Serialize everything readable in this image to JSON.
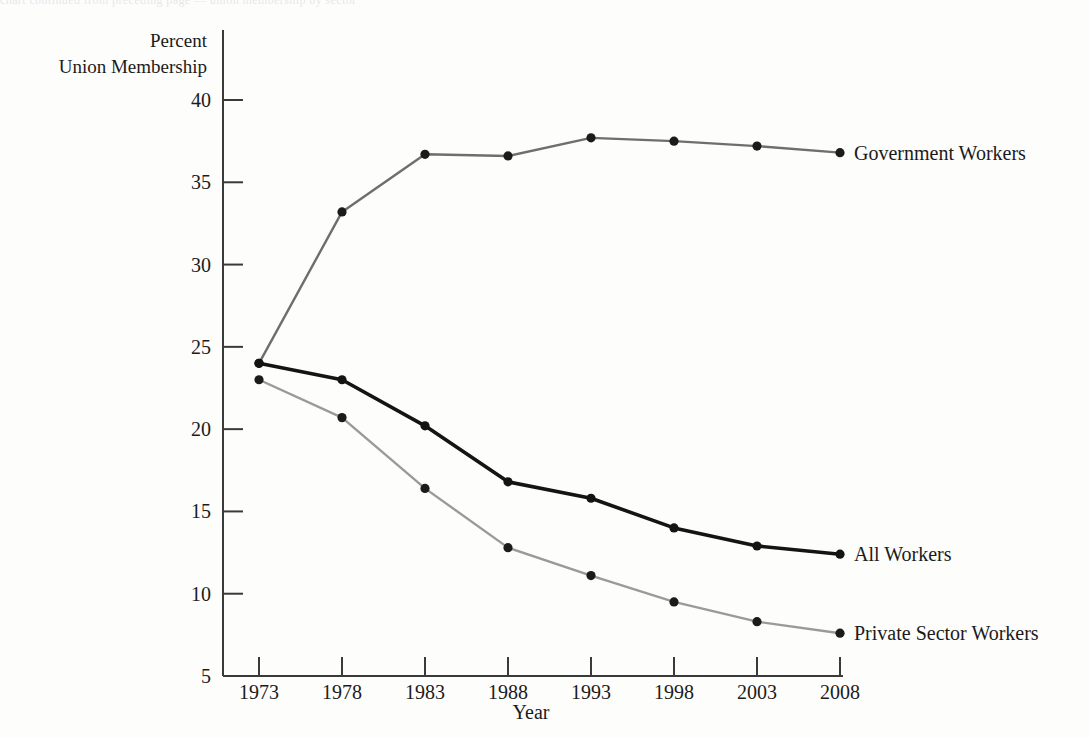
{
  "page": {
    "bleed_text": "chart continued from preceding page — union membership by sector"
  },
  "chart_data": {
    "type": "line",
    "title": "",
    "subtitle": "",
    "xlabel": "Year",
    "ylabel": "Percent Union Membership",
    "ylabel_lines": [
      "Percent",
      "Union Membership"
    ],
    "categories": [
      1973,
      1978,
      1983,
      1988,
      1993,
      1998,
      2003,
      2008
    ],
    "xtick_labels": [
      "1973",
      "1978",
      "1983",
      "1988",
      "1993",
      "1998",
      "2003",
      "2008"
    ],
    "ytick_labels": [
      "40",
      "35",
      "30",
      "25",
      "20",
      "15",
      "10",
      "5"
    ],
    "yticks": [
      40,
      35,
      30,
      25,
      20,
      15,
      10,
      5
    ],
    "ylim": [
      5,
      40
    ],
    "xlim": [
      1973,
      2008
    ],
    "grid": false,
    "legend_position": "right-inline-labels",
    "series": [
      {
        "name": "Government Workers",
        "color": "#6e6e6e",
        "marker_color": "#1b1b1b",
        "values": [
          24.0,
          33.2,
          36.7,
          36.6,
          37.7,
          37.5,
          37.2,
          36.8
        ]
      },
      {
        "name": "All Workers",
        "color": "#141414",
        "marker_color": "#141414",
        "values": [
          24.0,
          23.0,
          20.2,
          16.8,
          15.8,
          14.0,
          12.9,
          12.4
        ]
      },
      {
        "name": "Private Sector Workers",
        "color": "#9a9a9a",
        "marker_color": "#1b1b1b",
        "values": [
          23.0,
          20.7,
          16.4,
          12.8,
          11.1,
          9.5,
          8.3,
          7.6
        ]
      }
    ]
  }
}
